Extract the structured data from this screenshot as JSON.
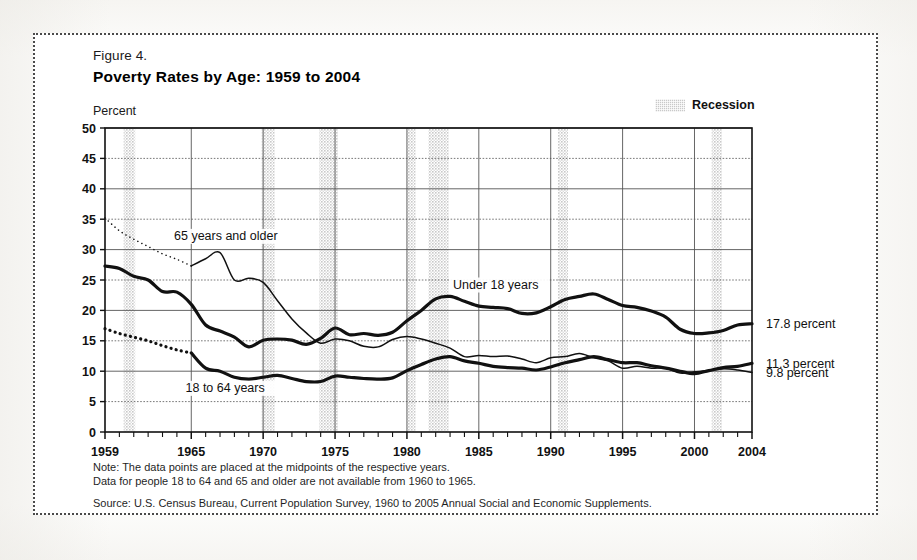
{
  "figure": {
    "number_label": "Figure 4.",
    "title": "Poverty Rates by Age:  1959 to 2004",
    "axis_unit_label": "Percent"
  },
  "legend": {
    "recession_label": "Recession",
    "recession_color": "#c9c9c9"
  },
  "notes": {
    "note_line1": "Note:  The data points are placed at the midpoints of the respective years.",
    "note_line2": "Data for people 18 to 64 and 65 and older are not available from 1960 to 1965.",
    "source": "Source:  U.S. Census Bureau, Current Population Survey, 1960 to 2005 Annual Social and Economic Supplements."
  },
  "end_labels": [
    {
      "text": "17.8 percent",
      "value": 17.8,
      "series": "Under 18 years"
    },
    {
      "text": "11.3 percent",
      "value": 11.3,
      "series": "65 years and older"
    },
    {
      "text": "9.8 percent",
      "value": 9.8,
      "series": "18 to 64 years"
    }
  ],
  "chart_data": {
    "type": "line",
    "title": "Poverty Rates by Age:  1959 to 2004",
    "xlabel": "",
    "ylabel": "Percent",
    "ylim": [
      0,
      50
    ],
    "xlim": [
      1959,
      2004
    ],
    "ytick_values": [
      0,
      5,
      10,
      15,
      20,
      25,
      30,
      35,
      40,
      45,
      50
    ],
    "xtick_labels": [
      "1959",
      "1965",
      "1970",
      "1975",
      "1980",
      "1985",
      "1990",
      "1995",
      "2000",
      "2004"
    ],
    "xtick_values": [
      1959,
      1965,
      1970,
      1975,
      1980,
      1985,
      1990,
      1995,
      2000,
      2004
    ],
    "grid": true,
    "legend_position": "in-plot annotations",
    "x": [
      1959,
      1960,
      1961,
      1962,
      1963,
      1964,
      1965,
      1966,
      1967,
      1968,
      1969,
      1970,
      1971,
      1972,
      1973,
      1974,
      1975,
      1976,
      1977,
      1978,
      1979,
      1980,
      1981,
      1982,
      1983,
      1984,
      1985,
      1986,
      1987,
      1988,
      1989,
      1990,
      1991,
      1992,
      1993,
      1994,
      1995,
      1996,
      1997,
      1998,
      1999,
      2000,
      2001,
      2002,
      2003,
      2004
    ],
    "series": [
      {
        "name": "Under 18 years",
        "label": "Under 18 years",
        "style": "solid-thick",
        "values": [
          27.3,
          26.9,
          25.6,
          25.0,
          23.1,
          23.0,
          21.0,
          17.6,
          16.6,
          15.6,
          14.0,
          15.1,
          15.3,
          15.1,
          14.4,
          15.4,
          17.1,
          16.0,
          16.2,
          15.9,
          16.4,
          18.3,
          20.0,
          21.9,
          22.3,
          21.5,
          20.7,
          20.5,
          20.3,
          19.5,
          19.6,
          20.6,
          21.8,
          22.3,
          22.7,
          21.8,
          20.8,
          20.5,
          19.9,
          18.9,
          16.9,
          16.2,
          16.3,
          16.7,
          17.6,
          17.8
        ],
        "end_value": 17.8,
        "dotted_range": null
      },
      {
        "name": "65 years and older",
        "label": "65 years and older",
        "style": "solid-thin",
        "values": [
          35.2,
          33.1,
          31.7,
          30.5,
          29.3,
          28.4,
          27.3,
          28.5,
          29.5,
          25.0,
          25.3,
          24.6,
          21.6,
          18.6,
          16.3,
          14.6,
          15.3,
          15.0,
          14.1,
          14.0,
          15.2,
          15.7,
          15.3,
          14.6,
          13.8,
          12.4,
          12.6,
          12.4,
          12.5,
          12.0,
          11.4,
          12.2,
          12.4,
          12.9,
          12.2,
          11.7,
          10.5,
          10.8,
          10.5,
          10.5,
          9.7,
          9.9,
          10.1,
          10.4,
          10.2,
          9.8
        ],
        "end_value": 9.8,
        "dotted_range": [
          1959,
          1965
        ],
        "dotted_note": "Data not available 1960 to 1965 — shown as dotted interpolation"
      },
      {
        "name": "18 to 64 years",
        "label": "18 to 64 years",
        "style": "solid-thick",
        "values": [
          17.0,
          16.2,
          15.6,
          15.0,
          14.2,
          13.5,
          13.0,
          10.5,
          10.0,
          9.0,
          8.7,
          9.0,
          9.3,
          8.8,
          8.3,
          8.3,
          9.2,
          9.0,
          8.8,
          8.7,
          8.9,
          10.1,
          11.1,
          12.0,
          12.4,
          11.7,
          11.3,
          10.8,
          10.6,
          10.5,
          10.2,
          10.7,
          11.4,
          11.9,
          12.4,
          11.9,
          11.4,
          11.4,
          10.9,
          10.5,
          10.0,
          9.6,
          10.1,
          10.6,
          10.8,
          11.3
        ],
        "end_value": 11.3,
        "dotted_range": [
          1959,
          1965
        ],
        "dotted_note": "Data not available 1960 to 1965 — shown as dotted interpolation"
      }
    ],
    "recession_bands": [
      {
        "start": 1960.3,
        "end": 1961.1
      },
      {
        "start": 1969.9,
        "end": 1970.8
      },
      {
        "start": 1973.9,
        "end": 1975.2
      },
      {
        "start": 1980.0,
        "end": 1980.6
      },
      {
        "start": 1981.5,
        "end": 1982.9
      },
      {
        "start": 1990.5,
        "end": 1991.2
      },
      {
        "start": 2001.2,
        "end": 2001.9
      }
    ]
  }
}
